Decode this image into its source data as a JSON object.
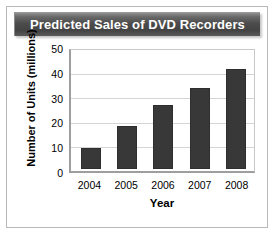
{
  "chart_data": {
    "type": "bar",
    "title": "Predicted Sales of DVD Recorders",
    "categories": [
      "2004",
      "2005",
      "2006",
      "2007",
      "2008"
    ],
    "values": [
      9,
      18,
      27,
      34,
      42
    ],
    "xlabel": "Year",
    "ylabel": "Number of Units (millions)",
    "ylim": [
      0,
      50
    ],
    "yticks": [
      0,
      10,
      20,
      30,
      40,
      50
    ],
    "ytick_labels": [
      "0",
      "10",
      "20",
      "30",
      "40",
      "50"
    ],
    "grid": true,
    "legend": null,
    "series": [
      {
        "name": "Predicted Sales",
        "values": [
          9,
          18,
          27,
          34,
          42
        ]
      }
    ],
    "colors": {
      "bar_fill": "#383838",
      "bar_edge": "#2e2e2e",
      "grid": "#d5d5d5",
      "axis": "#9e9e9e",
      "title_bar_dark": "#4c4c4c",
      "title_text": "#ffffff",
      "plot_background": "#ffffff",
      "figure_border": "#b8b8b8"
    }
  }
}
